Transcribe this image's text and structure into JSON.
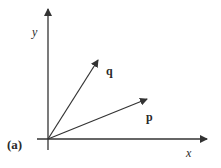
{
  "figure": {
    "panel_label": "(a)",
    "axes": {
      "x_label": "x",
      "y_label": "y"
    },
    "vectors": [
      {
        "name": "q",
        "label": "q"
      },
      {
        "name": "p",
        "label": "p"
      }
    ],
    "colors": {
      "stroke": "#333333",
      "text": "#2a2a2a",
      "background": "#ffffff"
    }
  }
}
